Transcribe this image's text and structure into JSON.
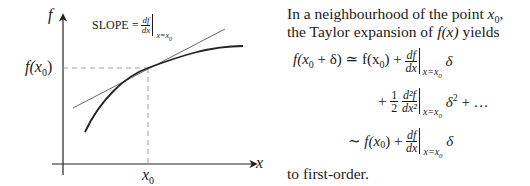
{
  "figure": {
    "y_axis_label": "f",
    "x_axis_label": "x",
    "x_tick_label": "x",
    "x_tick_sub": "0",
    "y_tick_label_pre": "f(",
    "y_tick_label_var": "x",
    "y_tick_label_sub": "0",
    "y_tick_label_post": ")",
    "slope_label": "SLOPE =",
    "slope_num": "df",
    "slope_den": "dx",
    "slope_eval": "x=x",
    "slope_eval_sub": "0"
  },
  "text": {
    "line1": "In a neighbourhood of the point ",
    "line1_var": "x",
    "line1_sub": "0",
    "line1_end": ",",
    "line2_a": "the Taylor expansion of ",
    "line2_f": "f(x)",
    "line2_b": " yields",
    "closing": "to first-order."
  },
  "equation": {
    "row1_lhs": "f(x",
    "row1_lhs_sub": "0",
    "row1_lhs_end": " + δ) ≃ f(x",
    "row1_rhs_sub": "0",
    "row1_rhs_end": ") +",
    "row1_num": "df",
    "row1_den": "dx",
    "eval": "x=x",
    "eval_sub": "0",
    "row1_tail": "δ",
    "row2_plus": "+",
    "row2_half_num": "1",
    "row2_half_den": "2",
    "row2_num": "d²f",
    "row2_den": "dx²",
    "row2_tail": "δ",
    "row2_sup": "2",
    "row2_end": " + …",
    "row3_lhs": "∼ f(x",
    "row3_sub": "0",
    "row3_end": ") +",
    "row3_num": "df",
    "row3_den": "dx",
    "row3_tail": "δ"
  }
}
